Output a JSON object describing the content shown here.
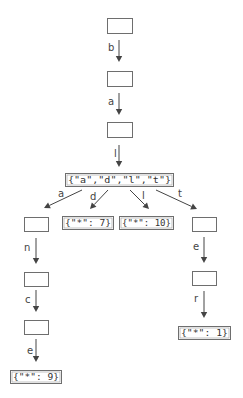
{
  "diagram": {
    "type": "trie",
    "nodes": [
      {
        "id": "n0",
        "label": ""
      },
      {
        "id": "n1",
        "label": ""
      },
      {
        "id": "n2",
        "label": ""
      },
      {
        "id": "n3",
        "label": "{\"a\",\"d\",\"l\",\"t\"}"
      },
      {
        "id": "n4",
        "label": ""
      },
      {
        "id": "n5",
        "label": "{\"*\": 7}"
      },
      {
        "id": "n6",
        "label": "{\"*\": 10}"
      },
      {
        "id": "n7",
        "label": ""
      },
      {
        "id": "n8",
        "label": ""
      },
      {
        "id": "n9",
        "label": ""
      },
      {
        "id": "n10",
        "label": "{\"*\": 9}"
      },
      {
        "id": "n11",
        "label": ""
      },
      {
        "id": "n12",
        "label": "{\"*\": 1}"
      }
    ],
    "edges": [
      {
        "from": "n0",
        "to": "n1",
        "label": "b"
      },
      {
        "from": "n1",
        "to": "n2",
        "label": "a"
      },
      {
        "from": "n2",
        "to": "n3",
        "label": "l"
      },
      {
        "from": "n3",
        "to": "n4",
        "label": "a"
      },
      {
        "from": "n3",
        "to": "n5",
        "label": "d"
      },
      {
        "from": "n3",
        "to": "n6",
        "label": "l"
      },
      {
        "from": "n3",
        "to": "n7",
        "label": "t"
      },
      {
        "from": "n4",
        "to": "n8",
        "label": "n"
      },
      {
        "from": "n8",
        "to": "n9",
        "label": "c"
      },
      {
        "from": "n9",
        "to": "n10",
        "label": "e"
      },
      {
        "from": "n7",
        "to": "n11",
        "label": "e"
      },
      {
        "from": "n11",
        "to": "n12",
        "label": "r"
      }
    ]
  }
}
